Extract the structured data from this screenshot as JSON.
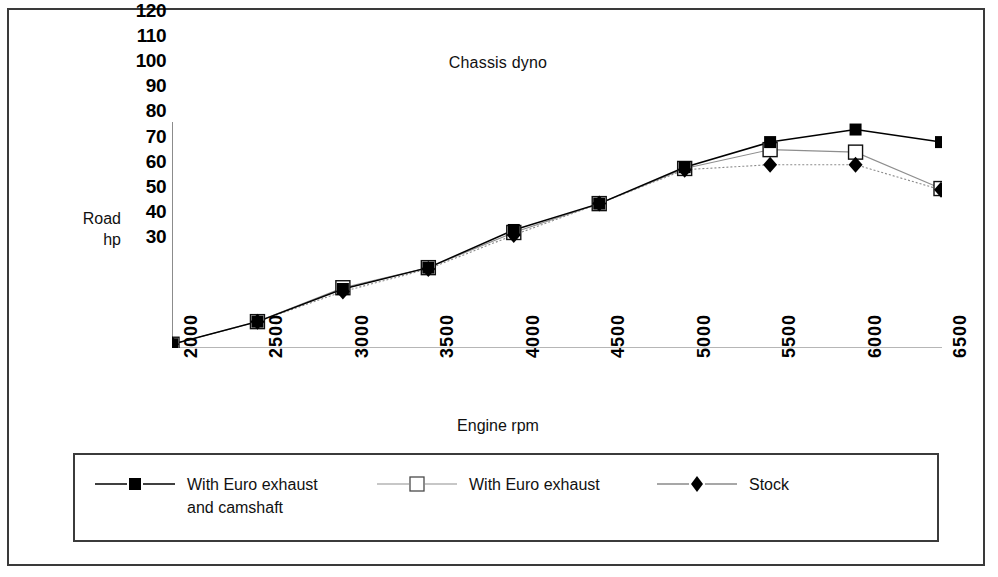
{
  "chart_data": {
    "type": "line",
    "title": "Chassis dyno",
    "xlabel": "Engine rpm",
    "ylabel": "Road hp",
    "ylabel_lines": [
      "Road",
      "hp"
    ],
    "categories": [
      2000,
      2500,
      3000,
      3500,
      4000,
      4500,
      5000,
      5500,
      6000,
      6500
    ],
    "xtick_labels": [
      "2000",
      "2500",
      "3000",
      "3500",
      "4000",
      "4500",
      "5000",
      "5500",
      "6000",
      "6500"
    ],
    "ytick_labels": [
      "120",
      "110",
      "100",
      "90",
      "80",
      "70",
      "60",
      "50",
      "40",
      "30"
    ],
    "ylim": [
      30,
      120
    ],
    "ytick_step": 10,
    "grid": false,
    "legend_position": "bottom",
    "series": [
      {
        "name": "With Euro exhaust\nand camshaft",
        "marker": "filled-square",
        "line_style": "solid",
        "color": "#000000",
        "values": [
          31.5,
          40.5,
          53.5,
          62,
          77,
          87.5,
          102,
          112,
          117,
          112
        ]
      },
      {
        "name": "With Euro exhaust",
        "marker": "open-square",
        "line_style": "solid-light",
        "color": "#6b6b6b",
        "values": [
          31.5,
          40.5,
          54,
          62,
          76,
          87.5,
          101.5,
          109,
          108,
          93.5
        ]
      },
      {
        "name": "Stock",
        "marker": "filled-diamond",
        "line_style": "dotted",
        "color": "#000000",
        "values": [
          31.5,
          40.5,
          52.5,
          61.5,
          75,
          87.5,
          101,
          103,
          103,
          93
        ]
      }
    ]
  },
  "legend": {
    "entries": [
      {
        "label": "With Euro exhaust\nand camshaft",
        "marker": "filled-square"
      },
      {
        "label": "With Euro exhaust",
        "marker": "open-square"
      },
      {
        "label": "Stock",
        "marker": "filled-diamond"
      }
    ]
  }
}
